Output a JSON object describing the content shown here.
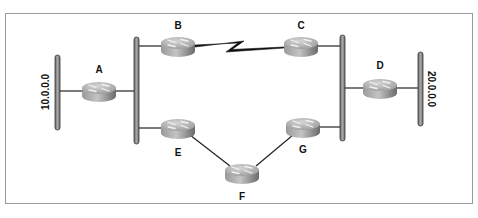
{
  "diagram": {
    "type": "network-topology",
    "routers": [
      {
        "id": "A",
        "label": "A",
        "cx": 99,
        "cy": 91,
        "label_x": 99,
        "label_y": 73
      },
      {
        "id": "B",
        "label": "B",
        "cx": 178,
        "cy": 46,
        "label_x": 178,
        "label_y": 29
      },
      {
        "id": "C",
        "label": "C",
        "cx": 301,
        "cy": 46,
        "label_x": 301,
        "label_y": 29
      },
      {
        "id": "D",
        "label": "D",
        "cx": 380,
        "cy": 88,
        "label_x": 380,
        "label_y": 69
      },
      {
        "id": "E",
        "label": "E",
        "cx": 178,
        "cy": 128,
        "label_x": 178,
        "label_y": 156
      },
      {
        "id": "F",
        "label": "F",
        "cx": 242,
        "cy": 173,
        "label_x": 242,
        "label_y": 200
      },
      {
        "id": "G",
        "label": "G",
        "cx": 303,
        "cy": 127,
        "label_x": 303,
        "label_y": 153
      }
    ],
    "networks": [
      {
        "id": "net-10",
        "label": "10.0.0.0",
        "x": 57,
        "y1": 55,
        "y2": 130,
        "label_x": 47,
        "label_y": 92,
        "rotate": -90
      },
      {
        "id": "net-20",
        "label": "20.0.0.0",
        "x": 420,
        "y1": 52,
        "y2": 126,
        "label_x": 430,
        "label_y": 89,
        "rotate": 90
      },
      {
        "id": "bus-left",
        "label": "",
        "x": 136,
        "y1": 37,
        "y2": 144
      },
      {
        "id": "bus-right",
        "label": "",
        "x": 342,
        "y1": 35,
        "y2": 141
      }
    ],
    "links": [
      {
        "from": "net-10",
        "to": "A",
        "kind": "ethernet"
      },
      {
        "from": "A",
        "to": "bus-left",
        "kind": "ethernet"
      },
      {
        "from": "bus-left",
        "to": "B",
        "kind": "ethernet"
      },
      {
        "from": "bus-left",
        "to": "E",
        "kind": "ethernet"
      },
      {
        "from": "B",
        "to": "C",
        "kind": "serial"
      },
      {
        "from": "C",
        "to": "bus-right",
        "kind": "ethernet"
      },
      {
        "from": "bus-right",
        "to": "D",
        "kind": "ethernet"
      },
      {
        "from": "bus-right",
        "to": "G",
        "kind": "ethernet"
      },
      {
        "from": "D",
        "to": "net-20",
        "kind": "ethernet"
      },
      {
        "from": "E",
        "to": "F",
        "kind": "point-to-point"
      },
      {
        "from": "F",
        "to": "G",
        "kind": "point-to-point"
      }
    ],
    "colors": {
      "frame": "#9a9a9a",
      "bar_fill": "#8c8c8c",
      "bar_outline": "#333333",
      "router_top": "#b8b8b8",
      "router_side": "#7a7a7a",
      "link": "#222222"
    }
  }
}
